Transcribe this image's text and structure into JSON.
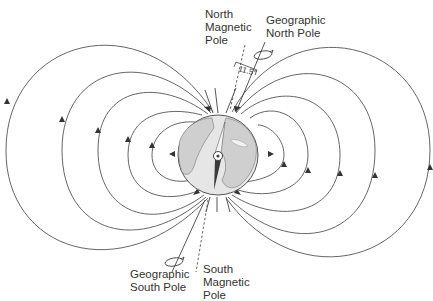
{
  "diagram": {
    "labels": {
      "north_magnetic_pole": "North\nMagnetic\nPole",
      "geographic_north_pole": "Geographic\nNorth Pole",
      "geographic_south_pole": "Geographic\nSouth Pole",
      "south_magnetic_pole": "South\nMagnetic\nPole",
      "tilt_angle": "11.5°"
    },
    "colors": {
      "line": "#444444",
      "globe_ocean": "#e4e4e4",
      "globe_land": "#c8c8c8",
      "needle": "#3a3a3a"
    }
  }
}
